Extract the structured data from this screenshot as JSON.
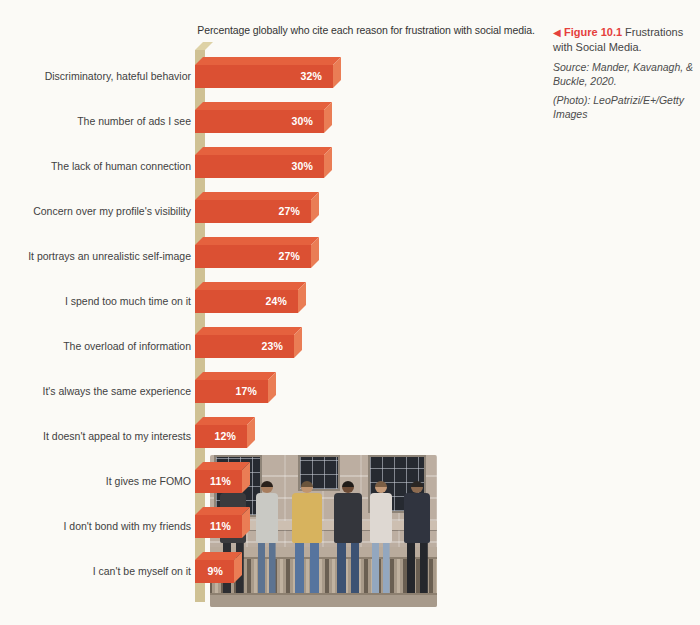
{
  "chart_data": {
    "type": "bar",
    "orientation": "horizontal",
    "title": "Percentage globally who cite each reason for frustration with social media.",
    "categories": [
      "Discriminatory, hateful behavior",
      "The number of ads I see",
      "The lack of human connection",
      "Concern over my profile's visibility",
      "It portrays an unrealistic self-image",
      "I spend too much time on it",
      "The overload of information",
      "It's always the same experience",
      "It doesn't appeal to my interests",
      "It gives me FOMO",
      "I don't bond with my friends",
      "I can't be myself on it"
    ],
    "values": [
      32,
      30,
      30,
      27,
      27,
      24,
      23,
      17,
      12,
      11,
      11,
      9
    ],
    "value_labels": [
      "32%",
      "30%",
      "30%",
      "27%",
      "27%",
      "24%",
      "23%",
      "17%",
      "12%",
      "11%",
      "11%",
      "9%"
    ],
    "unit": "percent",
    "xlim": [
      0,
      32
    ],
    "grid": false,
    "legend": null,
    "colors": {
      "bar_front": "#db5033",
      "bar_top": "#e5613e",
      "bar_end": "#ea7d55",
      "axis_column": "#cfc194",
      "axis_cap": "#ded2a6",
      "value_text": "#ffffff",
      "label_text": "#3f3f3f"
    }
  },
  "caption": {
    "marker": "◀",
    "figure_label": "Figure 10.1",
    "figure_title": "Frustrations with Social Media.",
    "source": "Source: Mander, Kavanagh, & Buckle, 2020.",
    "credit": "(Photo): LeoPatrizi/E+/Getty Images",
    "accent_color": "#e5403c"
  },
  "photo": {
    "description": "Six young people sitting side by side on a stone balustrade in front of a classical building, most looking down at their phones"
  }
}
